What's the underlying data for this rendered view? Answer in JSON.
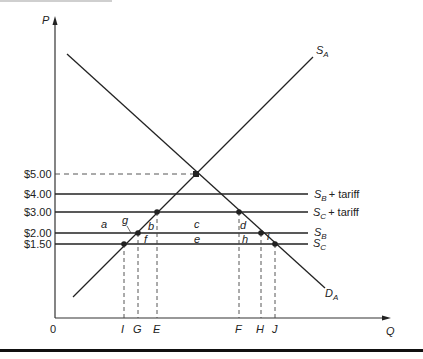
{
  "axes": {
    "y_label": "P",
    "x_label": "Q",
    "origin_label": "0"
  },
  "price_ticks": [
    {
      "label": "$5.00",
      "value": 5.0
    },
    {
      "label": "$4.00",
      "value": 4.0
    },
    {
      "label": "$3.00",
      "value": 3.0
    },
    {
      "label": "$2.00",
      "value": 2.0
    },
    {
      "label": "$1.50",
      "value": 1.5
    }
  ],
  "quantity_ticks": [
    "I",
    "G",
    "E",
    "F",
    "H",
    "J"
  ],
  "curves": {
    "supply_domestic": {
      "name": "S",
      "sub": "A"
    },
    "demand_domestic": {
      "name": "D",
      "sub": "A"
    },
    "sb_tariff": {
      "name": "S",
      "sub": "B",
      "suffix": "+ tariff"
    },
    "sc_tariff": {
      "name": "S",
      "sub": "C",
      "suffix": "+ tariff"
    },
    "sb": {
      "name": "S",
      "sub": "B"
    },
    "sc": {
      "name": "S",
      "sub": "C"
    }
  },
  "areas": {
    "a": "a",
    "b": "b",
    "c": "c",
    "d": "d",
    "e": "e",
    "f": "f",
    "g": "g",
    "h": "h",
    "i": "i"
  },
  "colors": {
    "line": "#222222",
    "dash": "#444444"
  }
}
